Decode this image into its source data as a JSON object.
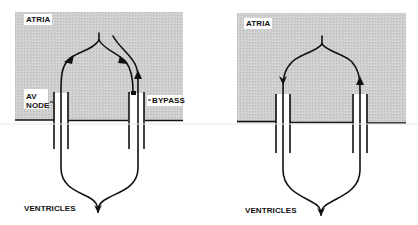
{
  "colors": {
    "atria_fill": "#c9c9c9",
    "stroke": "#111111",
    "background": "#ffffff"
  },
  "panels": [
    {
      "id": "left",
      "description": "Conduction via AV node and accessory bypass pathway",
      "atria_label": "ATRIA",
      "av_node_label": "AV\nNODE",
      "bypass_label": "BYPASS",
      "ventricles_label": "VENTRICLES"
    },
    {
      "id": "right",
      "description": "Conduction via two parallel pathways",
      "atria_label": "ATRIA",
      "ventricles_label": "VENTRICLES"
    }
  ]
}
